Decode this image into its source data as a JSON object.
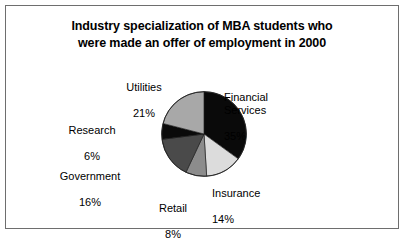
{
  "figure": {
    "title": "Industry specialization of MBA students who\nwere made an offer of employment in 2000",
    "border_color": "#6e6e6e",
    "background_color": "#ffffff"
  },
  "chart_data": {
    "type": "pie",
    "title": "Industry specialization of MBA students who were made an offer of employment in 2000",
    "xlabel": "",
    "ylabel": "",
    "units": "percent",
    "total": 100,
    "start_angle_deg": 0,
    "direction": "clockwise",
    "legend": "none",
    "grid": false,
    "categories": [
      "Financial Services",
      "Insurance",
      "Retail",
      "Government",
      "Research",
      "Utilities"
    ],
    "values": [
      35,
      14,
      8,
      16,
      6,
      21
    ],
    "slices": [
      {
        "name": "Financial Services",
        "label": "Financial\nServices",
        "value": 35,
        "pct_text": "35%",
        "color": "#0a0a0a",
        "start_deg": 0,
        "end_deg": 126
      },
      {
        "name": "Insurance",
        "label": "Insurance",
        "value": 14,
        "pct_text": "14%",
        "color": "#dcdcdc",
        "start_deg": 126,
        "end_deg": 176.4
      },
      {
        "name": "Retail",
        "label": "Retail",
        "value": 8,
        "pct_text": "8%",
        "color": "#8c8c8c",
        "start_deg": 176.4,
        "end_deg": 205.2
      },
      {
        "name": "Government",
        "label": "Government",
        "value": 16,
        "pct_text": "16%",
        "color": "#4a4a4a",
        "start_deg": 205.2,
        "end_deg": 262.8
      },
      {
        "name": "Research",
        "label": "Research",
        "value": 6,
        "pct_text": "6%",
        "color": "#0a0a0a",
        "start_deg": 262.8,
        "end_deg": 284.4
      },
      {
        "name": "Utilities",
        "label": "Utilities",
        "value": 21,
        "pct_text": "21%",
        "color": "#a8a8a8",
        "start_deg": 284.4,
        "end_deg": 360
      }
    ]
  }
}
